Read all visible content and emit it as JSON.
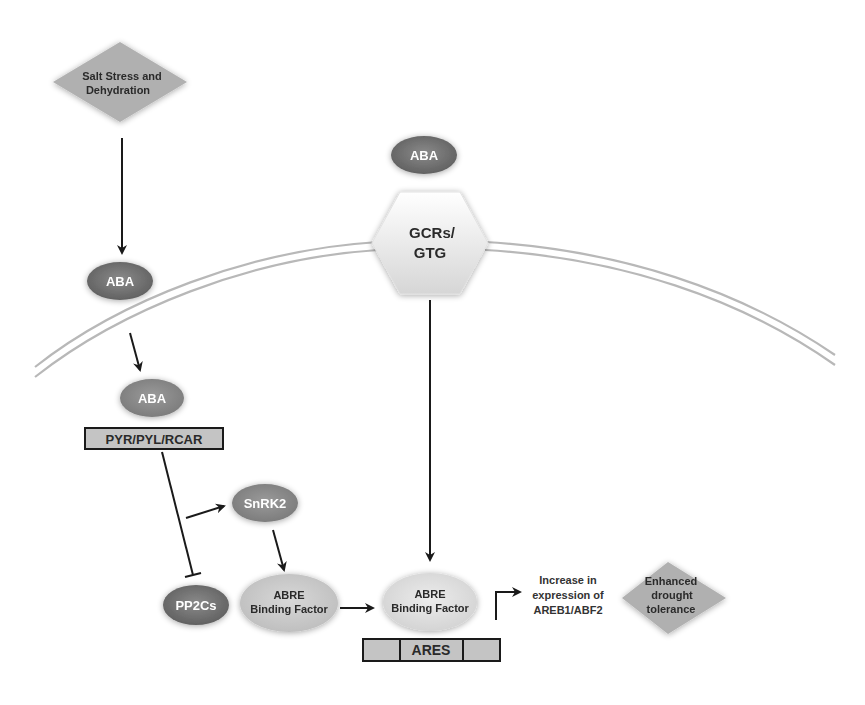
{
  "colors": {
    "background": "#ffffff",
    "membrane": "#b8b8b8",
    "aba_node": "#7a7a7a",
    "light_node": "#c8c8c8",
    "diamond": "#b0b0b0",
    "arrow": "#1a1a1a",
    "receptor_box": "#c4c4c4"
  },
  "nodes": {
    "salt_stress": {
      "line1": "Salt Stress and",
      "line2": "Dehydration"
    },
    "aba_outside_left": {
      "label": "ABA"
    },
    "aba_outside_top": {
      "label": "ABA"
    },
    "gcrs": {
      "line1": "GCRs/",
      "line2": "GTG"
    },
    "aba_inside": {
      "label": "ABA"
    },
    "receptor": {
      "label": "PYR/PYL/RCAR"
    },
    "snrk2": {
      "label": "SnRK2"
    },
    "pp2cs": {
      "label": "PP2Cs"
    },
    "abre_bf_left": {
      "line1": "ABRE",
      "line2": "Binding Factor"
    },
    "abre_bf_right": {
      "line1": "ABRE",
      "line2": "Binding Factor"
    },
    "ares": {
      "label": "ARES"
    },
    "expression": {
      "line1": "Increase in",
      "line2": "expression of",
      "line3": "AREB1/ABF2"
    },
    "outcome": {
      "line1": "Enhanced",
      "line2": "drought",
      "line3": "tolerance"
    }
  },
  "edges": [
    {
      "from": "salt_stress",
      "to": "aba_outside_left",
      "type": "activate"
    },
    {
      "from": "aba_outside_left",
      "to": "aba_inside",
      "type": "activate"
    },
    {
      "from": "receptor",
      "to": "pp2cs",
      "type": "inhibit"
    },
    {
      "from": "receptor",
      "to": "snrk2",
      "type": "activate"
    },
    {
      "from": "snrk2",
      "to": "abre_bf_left",
      "type": "activate"
    },
    {
      "from": "abre_bf_left",
      "to": "abre_bf_right",
      "type": "activate"
    },
    {
      "from": "gcrs",
      "to": "abre_bf_right",
      "type": "activate"
    },
    {
      "from": "ares",
      "to": "expression",
      "type": "activate"
    }
  ]
}
